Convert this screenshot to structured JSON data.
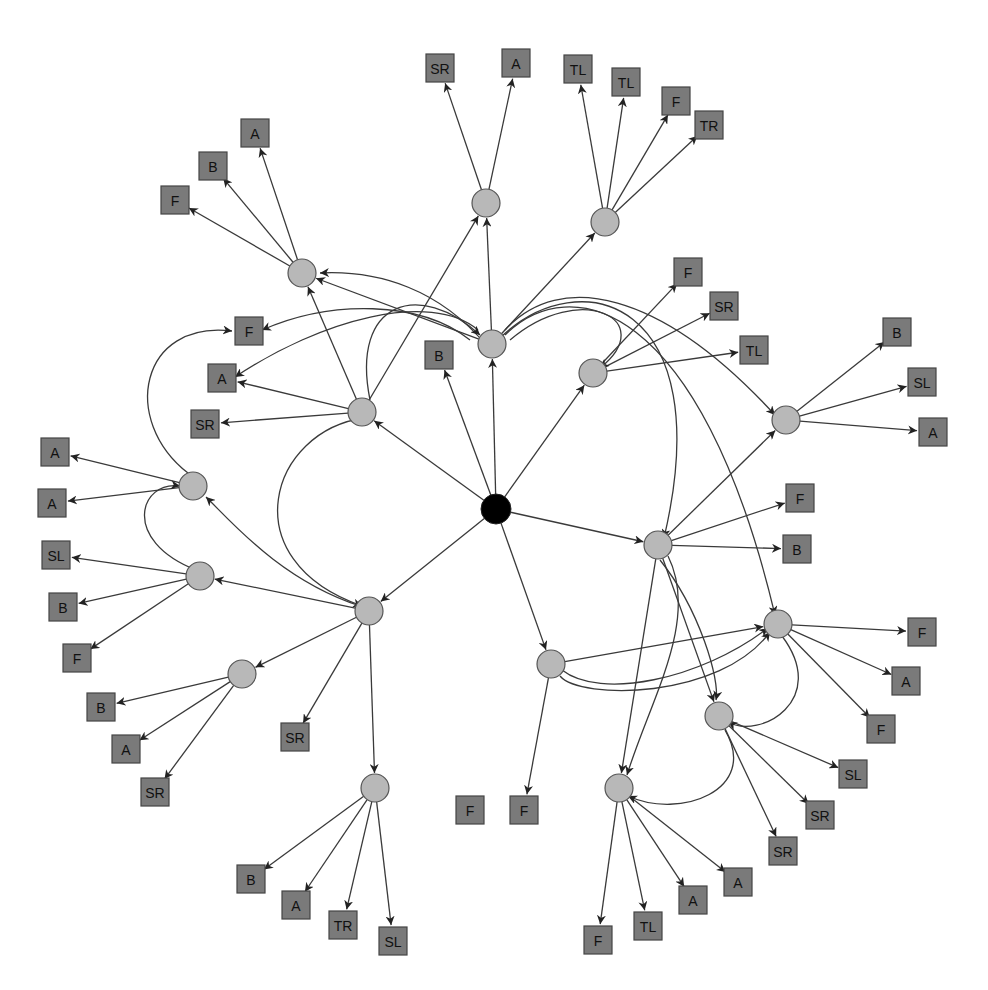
{
  "diagram": {
    "type": "directed-tree-network",
    "colors": {
      "hub": "#000000",
      "inner_node": "#b8b8b8",
      "leaf_node": "#7a7a7a",
      "edge": "#3a3a3a",
      "background": "#ffffff"
    },
    "hub": {
      "id": "root",
      "x": 496,
      "y": 509
    },
    "inner_nodes": [
      {
        "id": "c1",
        "x": 302,
        "y": 273
      },
      {
        "id": "c2",
        "x": 486,
        "y": 203
      },
      {
        "id": "c3",
        "x": 605,
        "y": 222
      },
      {
        "id": "c4",
        "x": 492,
        "y": 344
      },
      {
        "id": "c5",
        "x": 593,
        "y": 373
      },
      {
        "id": "c6",
        "x": 786,
        "y": 420
      },
      {
        "id": "c7",
        "x": 362,
        "y": 412
      },
      {
        "id": "c8",
        "x": 193,
        "y": 486
      },
      {
        "id": "c9",
        "x": 200,
        "y": 576
      },
      {
        "id": "c10",
        "x": 369,
        "y": 611
      },
      {
        "id": "c11",
        "x": 242,
        "y": 674
      },
      {
        "id": "c12",
        "x": 375,
        "y": 788
      },
      {
        "id": "c13",
        "x": 658,
        "y": 545
      },
      {
        "id": "c14",
        "x": 551,
        "y": 664
      },
      {
        "id": "c15",
        "x": 778,
        "y": 624
      },
      {
        "id": "c16",
        "x": 719,
        "y": 716
      },
      {
        "id": "c17",
        "x": 619,
        "y": 788
      }
    ],
    "leaves": [
      {
        "label": "F",
        "x": 175,
        "y": 200
      },
      {
        "label": "B",
        "x": 213,
        "y": 166
      },
      {
        "label": "A",
        "x": 255,
        "y": 133
      },
      {
        "label": "SR",
        "x": 440,
        "y": 68
      },
      {
        "label": "A",
        "x": 516,
        "y": 63
      },
      {
        "label": "TL",
        "x": 578,
        "y": 69
      },
      {
        "label": "TL",
        "x": 626,
        "y": 82
      },
      {
        "label": "F",
        "x": 676,
        "y": 101
      },
      {
        "label": "TR",
        "x": 709,
        "y": 125
      },
      {
        "label": "B",
        "x": 439,
        "y": 355
      },
      {
        "label": "F",
        "x": 688,
        "y": 272
      },
      {
        "label": "SR",
        "x": 724,
        "y": 306
      },
      {
        "label": "TL",
        "x": 754,
        "y": 350
      },
      {
        "label": "B",
        "x": 897,
        "y": 332
      },
      {
        "label": "SL",
        "x": 922,
        "y": 382
      },
      {
        "label": "A",
        "x": 933,
        "y": 432
      },
      {
        "label": "F",
        "x": 249,
        "y": 331
      },
      {
        "label": "A",
        "x": 222,
        "y": 378
      },
      {
        "label": "SR",
        "x": 205,
        "y": 424
      },
      {
        "label": "A",
        "x": 55,
        "y": 452
      },
      {
        "label": "A",
        "x": 52,
        "y": 503
      },
      {
        "label": "SL",
        "x": 56,
        "y": 555
      },
      {
        "label": "B",
        "x": 63,
        "y": 607
      },
      {
        "label": "F",
        "x": 77,
        "y": 658
      },
      {
        "label": "B",
        "x": 101,
        "y": 707
      },
      {
        "label": "A",
        "x": 126,
        "y": 749
      },
      {
        "label": "SR",
        "x": 155,
        "y": 792
      },
      {
        "label": "SR",
        "x": 295,
        "y": 737
      },
      {
        "label": "B",
        "x": 251,
        "y": 879
      },
      {
        "label": "A",
        "x": 296,
        "y": 905
      },
      {
        "label": "TR",
        "x": 343,
        "y": 925
      },
      {
        "label": "SL",
        "x": 393,
        "y": 941
      },
      {
        "label": "F",
        "x": 470,
        "y": 810
      },
      {
        "label": "F",
        "x": 524,
        "y": 810
      },
      {
        "label": "F",
        "x": 800,
        "y": 498
      },
      {
        "label": "B",
        "x": 797,
        "y": 549
      },
      {
        "label": "F",
        "x": 922,
        "y": 632
      },
      {
        "label": "A",
        "x": 906,
        "y": 681
      },
      {
        "label": "F",
        "x": 881,
        "y": 729
      },
      {
        "label": "SL",
        "x": 853,
        "y": 774
      },
      {
        "label": "SR",
        "x": 820,
        "y": 815
      },
      {
        "label": "SR",
        "x": 783,
        "y": 851
      },
      {
        "label": "A",
        "x": 738,
        "y": 882
      },
      {
        "label": "A",
        "x": 693,
        "y": 900
      },
      {
        "label": "TL",
        "x": 648,
        "y": 926
      },
      {
        "label": "F",
        "x": 598,
        "y": 940
      }
    ],
    "straight_edges": [
      [
        496,
        509,
        362,
        412
      ],
      [
        496,
        509,
        492,
        344
      ],
      [
        496,
        509,
        439,
        355
      ],
      [
        496,
        509,
        593,
        373
      ],
      [
        496,
        509,
        658,
        545
      ],
      [
        496,
        509,
        551,
        664
      ],
      [
        496,
        509,
        369,
        611
      ],
      [
        492,
        344,
        486,
        203
      ],
      [
        492,
        344,
        605,
        222
      ],
      [
        492,
        344,
        302,
        273
      ],
      [
        486,
        203,
        440,
        68
      ],
      [
        486,
        203,
        516,
        63
      ],
      [
        605,
        222,
        578,
        69
      ],
      [
        605,
        222,
        626,
        82
      ],
      [
        605,
        222,
        676,
        101
      ],
      [
        605,
        222,
        709,
        125
      ],
      [
        302,
        273,
        175,
        200
      ],
      [
        302,
        273,
        213,
        166
      ],
      [
        302,
        273,
        255,
        133
      ],
      [
        362,
        412,
        302,
        273
      ],
      [
        362,
        412,
        486,
        203
      ],
      [
        362,
        412,
        222,
        378
      ],
      [
        362,
        412,
        205,
        424
      ],
      [
        593,
        373,
        688,
        272
      ],
      [
        593,
        373,
        724,
        306
      ],
      [
        593,
        373,
        754,
        350
      ],
      [
        786,
        420,
        897,
        332
      ],
      [
        786,
        420,
        922,
        382
      ],
      [
        786,
        420,
        933,
        432
      ],
      [
        193,
        486,
        55,
        452
      ],
      [
        193,
        486,
        52,
        503
      ],
      [
        200,
        576,
        56,
        555
      ],
      [
        200,
        576,
        63,
        607
      ],
      [
        200,
        576,
        77,
        658
      ],
      [
        369,
        611,
        242,
        674
      ],
      [
        369,
        611,
        295,
        737
      ],
      [
        369,
        611,
        375,
        788
      ],
      [
        369,
        611,
        200,
        576
      ],
      [
        242,
        674,
        101,
        707
      ],
      [
        242,
        674,
        126,
        749
      ],
      [
        242,
        674,
        155,
        792
      ],
      [
        375,
        788,
        251,
        879
      ],
      [
        375,
        788,
        296,
        905
      ],
      [
        375,
        788,
        343,
        925
      ],
      [
        375,
        788,
        393,
        941
      ],
      [
        658,
        545,
        800,
        498
      ],
      [
        658,
        545,
        797,
        549
      ],
      [
        658,
        545,
        786,
        420
      ],
      [
        658,
        545,
        619,
        788
      ],
      [
        658,
        545,
        719,
        716
      ],
      [
        551,
        664,
        524,
        810
      ],
      [
        551,
        664,
        778,
        624
      ],
      [
        778,
        624,
        922,
        632
      ],
      [
        778,
        624,
        906,
        681
      ],
      [
        778,
        624,
        881,
        729
      ],
      [
        719,
        716,
        853,
        774
      ],
      [
        719,
        716,
        820,
        815
      ],
      [
        719,
        716,
        783,
        851
      ],
      [
        619,
        788,
        598,
        940
      ],
      [
        619,
        788,
        648,
        926
      ],
      [
        619,
        788,
        693,
        900
      ],
      [
        619,
        788,
        738,
        882
      ]
    ],
    "curved_edges": [
      "M 486 345 C 440 290, 380 270, 320 273",
      "M 470 340 C 420 300, 330 300, 262 330",
      "M 478 330 C 430 290, 320 320, 235 377",
      "M 505 330 C 560 270, 660 290, 775 415",
      "M 505 335 C 570 270, 700 300, 775 615",
      "M 500 338 C 580 260, 720 300, 664 538",
      "M 510 340 C 580 280, 660 320, 600 368",
      "M 370 400 C 350 300, 420 280, 480 335",
      "M 365 418 C 270 430, 230 560, 362 606",
      "M 188 473 C 120 420, 140 320, 232 331",
      "M 196 570 C 120 540, 140 480, 180 486",
      "M 360 606 C 280 580, 230 520, 206 497",
      "M 562 670 C 600 700, 700 680, 768 628",
      "M 560 676 C 580 700, 720 700, 770 632",
      "M 660 560 C 700 610, 720 680, 716 700",
      "M 668 556 C 700 620, 650 700, 627 775",
      "M 782 636 C 830 700, 760 740, 728 722",
      "M 725 730 C 760 790, 680 820, 628 796"
    ]
  }
}
